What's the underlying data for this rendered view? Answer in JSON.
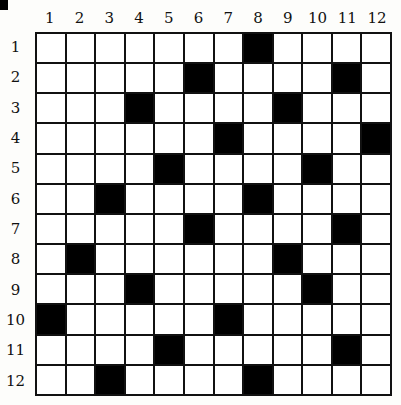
{
  "puzzle": {
    "type": "crossword-grid",
    "rows": 12,
    "cols": 12,
    "column_labels": [
      "1",
      "2",
      "3",
      "4",
      "5",
      "6",
      "7",
      "8",
      "9",
      "10",
      "11",
      "12"
    ],
    "row_labels": [
      "1",
      "2",
      "3",
      "4",
      "5",
      "6",
      "7",
      "8",
      "9",
      "10",
      "11",
      "12"
    ],
    "black_cells": [
      [
        1,
        8
      ],
      [
        2,
        6
      ],
      [
        2,
        11
      ],
      [
        3,
        4
      ],
      [
        3,
        9
      ],
      [
        4,
        7
      ],
      [
        4,
        12
      ],
      [
        5,
        5
      ],
      [
        5,
        10
      ],
      [
        6,
        3
      ],
      [
        6,
        8
      ],
      [
        7,
        6
      ],
      [
        7,
        11
      ],
      [
        8,
        2
      ],
      [
        8,
        9
      ],
      [
        9,
        4
      ],
      [
        9,
        10
      ],
      [
        10,
        1
      ],
      [
        10,
        7
      ],
      [
        11,
        5
      ],
      [
        11,
        11
      ],
      [
        12,
        3
      ],
      [
        12,
        8
      ]
    ],
    "colors": {
      "black": "#000000",
      "white": "#ffffff",
      "line": "#111111"
    }
  }
}
